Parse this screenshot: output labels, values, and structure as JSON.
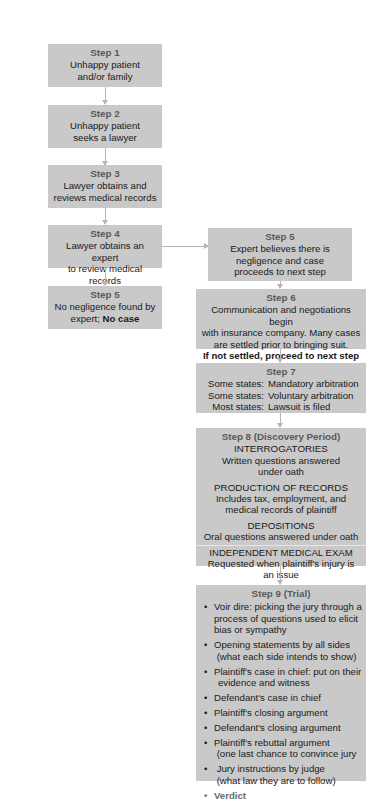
{
  "diagram": {
    "type": "flowchart",
    "colors": {
      "box_fill": "#c9c9c9",
      "arrow": "#b5b5b5",
      "title_text": "#5a5a5a",
      "body_text": "#1a1a1a"
    },
    "left_column": [
      {
        "title": "Step 1",
        "lines": [
          "Unhappy patient",
          "and/or family"
        ]
      },
      {
        "title": "Step 2",
        "lines": [
          "Unhappy patient",
          "seeks a lawyer"
        ]
      },
      {
        "title": "Step 3",
        "lines": [
          "Lawyer obtains and",
          "reviews medical records"
        ]
      },
      {
        "title": "Step 4",
        "lines": [
          "Lawyer obtains an expert",
          "to review medical records"
        ]
      },
      {
        "title": "Step 5",
        "lines": [
          "No negligence found by"
        ],
        "line2_normal": "expert; ",
        "line2_bold": "No case"
      }
    ],
    "right_column": {
      "step5": {
        "title": "Step 5",
        "lines": [
          "Expert believes there is",
          "negligence and case",
          "proceeds to next step"
        ]
      },
      "step6": {
        "title": "Step 6",
        "lines": [
          "Communication and negotiations begin",
          "with insurance company. Many cases",
          "are settled prior to bringing suit."
        ],
        "bold_line": "If not settled, proceed to next step"
      },
      "step7": {
        "title": "Step 7",
        "rows": [
          {
            "label": "Some states:",
            "value": "Mandatory arbitration"
          },
          {
            "label": "Some states:",
            "value": "Voluntary arbitration"
          },
          {
            "label": "Most states:",
            "value": "Lawsuit is filed"
          }
        ]
      },
      "step8": {
        "title": "Step 8 (Discovery Period)",
        "sections": [
          {
            "heading": "INTERROGATORIES",
            "lines": [
              "Written questions answered",
              "under oath"
            ]
          },
          {
            "heading": "PRODUCTION OF RECORDS",
            "lines": [
              "Includes tax, employment, and",
              "medical records of plaintiff"
            ]
          },
          {
            "heading": "DEPOSITIONS",
            "lines": [
              "Oral questions answered under oath"
            ]
          },
          {
            "heading": "INDEPENDENT MEDICAL EXAM",
            "lines": [
              "Requested when plaintiff's injury is",
              "an issue"
            ]
          }
        ]
      },
      "step9": {
        "title": "Step 9 (Trial)",
        "items": [
          {
            "lines": [
              "Voir dire:  picking the jury through a",
              "process of questions used to elicit",
              "bias or sympathy"
            ]
          },
          {
            "lines": [
              "Opening statements by all sides",
              " (what each side intends to show)"
            ]
          },
          {
            "lines": [
              "Plaintiff's case in chief: put on their",
              "evidence and witness"
            ]
          },
          {
            "lines": [
              "Defendant's case in chief"
            ]
          },
          {
            "lines": [
              "Plaintiff's closing argument"
            ]
          },
          {
            "lines": [
              "Defendant's closing argument"
            ]
          },
          {
            "lines": [
              "Plaintiff's rebuttal argument",
              " (one last chance to convince jury"
            ]
          },
          {
            "lines": [
              " Jury instructions by judge",
              " (what law they are to follow)"
            ]
          }
        ],
        "final_item": "Verdict"
      }
    }
  }
}
